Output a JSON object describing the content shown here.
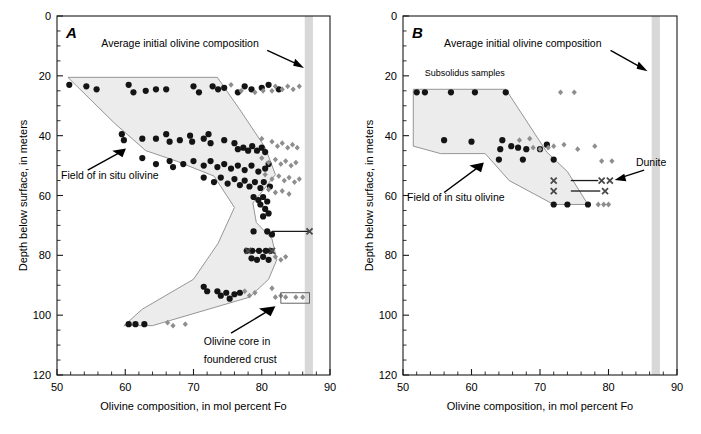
{
  "figure": {
    "background": "#ffffff",
    "width": 701,
    "height": 434,
    "caption_partial": ""
  },
  "colors": {
    "circle": "#141414",
    "diamond": "#8e8e8e",
    "x_marker": "#4a4a4a",
    "field_fill": "#ececec",
    "field_stroke": "#8a8a8a",
    "band": "#d8d8d8",
    "axis": "#1a1a1a"
  },
  "axes": {
    "x": {
      "label": "Olivine composition, in mol percent Fo",
      "min": 50,
      "max": 90,
      "major_ticks": [
        50,
        60,
        70,
        80,
        90
      ],
      "tick_labels": [
        "50",
        "60",
        "70",
        "80",
        "90"
      ],
      "minor_step": 2
    },
    "y": {
      "label": "Depth below surface, in meters",
      "min": 0,
      "max": 120,
      "major_ticks": [
        0,
        20,
        40,
        60,
        80,
        100,
        120
      ],
      "tick_labels": [
        "0",
        "20",
        "40",
        "60",
        "80",
        "100",
        "120"
      ],
      "minor_step": 5,
      "inverted": true
    }
  },
  "annotations": {
    "average_initial": "Average initial olivine composition",
    "field_in_situ": "Field of in situ olivine",
    "olivine_core_line1": "Olivine core in",
    "olivine_core_line2": "foundered crust",
    "subsolidus": "Subsolidus samples",
    "dunite": "Dunite"
  },
  "chart_data": [
    {
      "type": "scatter",
      "panel": "A",
      "title": "A",
      "xlabel": "Olivine composition, in mol percent Fo",
      "ylabel": "Depth below surface, in meters",
      "xlim": [
        50,
        90
      ],
      "ylim": [
        120,
        0
      ],
      "grid": false,
      "legend": "none",
      "band": {
        "name": "Average initial olivine composition",
        "x_start": 86.3,
        "x_end": 87.5
      },
      "field_polygon": {
        "name": "Field of in situ olivine",
        "vertices": [
          [
            51.6,
            20.5
          ],
          [
            73.5,
            20.5
          ],
          [
            77.0,
            32.0
          ],
          [
            80.5,
            44.0
          ],
          [
            82.0,
            53.0
          ],
          [
            80.3,
            58.0
          ],
          [
            78.7,
            62.5
          ],
          [
            79.2,
            69.0
          ],
          [
            81.5,
            74.5
          ],
          [
            82.2,
            81.5
          ],
          [
            81.0,
            88.0
          ],
          [
            78.2,
            94.0
          ],
          [
            64.0,
            103.5
          ],
          [
            59.8,
            103.5
          ],
          [
            62.5,
            98.0
          ],
          [
            70.0,
            88.0
          ],
          [
            73.6,
            76.0
          ],
          [
            76.0,
            64.0
          ],
          [
            73.0,
            53.5
          ],
          [
            67.5,
            48.5
          ],
          [
            63.0,
            45.0
          ],
          [
            58.5,
            36.0
          ]
        ]
      },
      "series": [
        {
          "name": "olivine (black circles)",
          "marker": "circle",
          "color": "#141414",
          "points": [
            [
              51.8,
              23.0
            ],
            [
              54.3,
              23.5
            ],
            [
              55.8,
              24.5
            ],
            [
              60.5,
              23.0
            ],
            [
              61.2,
              25.5
            ],
            [
              63.0,
              25.0
            ],
            [
              64.5,
              24.5
            ],
            [
              66.0,
              24.5
            ],
            [
              70.0,
              23.5
            ],
            [
              70.8,
              25.5
            ],
            [
              72.8,
              23.5
            ],
            [
              73.6,
              24.5
            ],
            [
              74.5,
              24.0
            ],
            [
              76.5,
              25.5
            ],
            [
              77.5,
              23.5
            ],
            [
              78.5,
              24.5
            ],
            [
              80.0,
              24.0
            ],
            [
              81.0,
              23.0
            ],
            [
              82.5,
              24.5
            ],
            [
              59.5,
              39.5
            ],
            [
              59.8,
              41.5
            ],
            [
              62.5,
              41.0
            ],
            [
              64.5,
              41.0
            ],
            [
              66.0,
              39.5
            ],
            [
              66.5,
              42.0
            ],
            [
              68.0,
              41.5
            ],
            [
              69.5,
              40.0
            ],
            [
              69.8,
              42.0
            ],
            [
              71.5,
              41.0
            ],
            [
              72.2,
              39.5
            ],
            [
              72.5,
              42.5
            ],
            [
              74.5,
              41.5
            ],
            [
              76.0,
              42.5
            ],
            [
              76.5,
              44.5
            ],
            [
              77.3,
              44.0
            ],
            [
              78.0,
              45.0
            ],
            [
              78.6,
              43.5
            ],
            [
              79.3,
              45.0
            ],
            [
              80.0,
              44.0
            ],
            [
              80.5,
              45.5
            ],
            [
              62.5,
              47.5
            ],
            [
              64.5,
              49.5
            ],
            [
              66.5,
              48.5
            ],
            [
              67.0,
              50.5
            ],
            [
              68.5,
              49.5
            ],
            [
              70.0,
              48.5
            ],
            [
              71.5,
              50.0
            ],
            [
              72.5,
              48.5
            ],
            [
              73.5,
              50.5
            ],
            [
              74.5,
              49.5
            ],
            [
              75.5,
              51.0
            ],
            [
              76.5,
              50.0
            ],
            [
              77.5,
              51.5
            ],
            [
              78.5,
              50.0
            ],
            [
              79.5,
              52.0
            ],
            [
              80.5,
              51.0
            ],
            [
              81.0,
              49.5
            ],
            [
              71.5,
              54.0
            ],
            [
              73.0,
              55.5
            ],
            [
              74.0,
              54.0
            ],
            [
              75.0,
              56.0
            ],
            [
              76.0,
              54.5
            ],
            [
              76.8,
              56.5
            ],
            [
              77.5,
              55.0
            ],
            [
              78.2,
              57.0
            ],
            [
              79.0,
              55.5
            ],
            [
              79.8,
              57.5
            ],
            [
              80.3,
              55.5
            ],
            [
              81.2,
              57.0
            ],
            [
              78.8,
              60.5
            ],
            [
              79.5,
              61.5
            ],
            [
              80.2,
              60.5
            ],
            [
              80.8,
              62.0
            ],
            [
              79.8,
              63.0
            ],
            [
              80.5,
              64.5
            ],
            [
              81.0,
              66.0
            ],
            [
              80.2,
              67.0
            ],
            [
              78.8,
              72.0
            ],
            [
              80.8,
              72.0
            ],
            [
              81.5,
              73.0
            ],
            [
              77.8,
              78.5
            ],
            [
              78.6,
              78.5
            ],
            [
              79.6,
              78.5
            ],
            [
              80.6,
              78.5
            ],
            [
              81.3,
              78.5
            ],
            [
              78.5,
              81.0
            ],
            [
              79.3,
              81.5
            ],
            [
              80.2,
              80.5
            ],
            [
              81.0,
              81.5
            ],
            [
              71.5,
              90.5
            ],
            [
              72.0,
              92.0
            ],
            [
              73.5,
              92.0
            ],
            [
              74.0,
              93.5
            ],
            [
              74.8,
              92.5
            ],
            [
              75.3,
              94.5
            ],
            [
              76.0,
              93.0
            ],
            [
              76.8,
              92.5
            ],
            [
              60.5,
              103.0
            ],
            [
              61.5,
              103.0
            ],
            [
              62.8,
              103.0
            ]
          ]
        },
        {
          "name": "olivine (gray diamonds)",
          "marker": "diamond",
          "color": "#8e8e8e",
          "points": [
            [
              75.5,
              23.0
            ],
            [
              77.0,
              25.0
            ],
            [
              79.0,
              25.5
            ],
            [
              80.2,
              25.0
            ],
            [
              81.5,
              25.0
            ],
            [
              82.0,
              23.5
            ],
            [
              83.0,
              24.5
            ],
            [
              83.8,
              23.5
            ],
            [
              84.6,
              24.5
            ],
            [
              85.5,
              23.5
            ],
            [
              80.0,
              41.0
            ],
            [
              81.5,
              42.0
            ],
            [
              82.3,
              43.5
            ],
            [
              83.0,
              42.5
            ],
            [
              83.8,
              44.0
            ],
            [
              84.5,
              43.0
            ],
            [
              85.2,
              44.0
            ],
            [
              80.0,
              47.5
            ],
            [
              81.0,
              49.0
            ],
            [
              82.0,
              48.0
            ],
            [
              82.8,
              49.5
            ],
            [
              83.5,
              48.5
            ],
            [
              84.3,
              50.0
            ],
            [
              85.0,
              49.0
            ],
            [
              80.5,
              53.0
            ],
            [
              81.5,
              54.5
            ],
            [
              82.5,
              53.5
            ],
            [
              83.3,
              55.0
            ],
            [
              84.0,
              54.0
            ],
            [
              84.8,
              55.5
            ],
            [
              85.5,
              54.5
            ],
            [
              81.0,
              58.0
            ],
            [
              82.0,
              59.0
            ],
            [
              83.0,
              58.5
            ],
            [
              84.0,
              59.5
            ],
            [
              82.0,
              80.5
            ],
            [
              82.8,
              81.5
            ],
            [
              83.5,
              80.5
            ],
            [
              77.5,
              92.0
            ],
            [
              78.2,
              93.5
            ],
            [
              79.0,
              92.5
            ],
            [
              81.5,
              91.0
            ],
            [
              82.0,
              94.0
            ],
            [
              82.8,
              93.5
            ],
            [
              83.5,
              94.0
            ],
            [
              85.0,
              94.0
            ],
            [
              86.0,
              94.0
            ],
            [
              66.2,
              102.5
            ],
            [
              67.0,
              103.5
            ],
            [
              68.8,
              103.0
            ]
          ]
        },
        {
          "name": "dunite olivine (x markers)",
          "marker": "x",
          "color": "#4a4a4a",
          "points": [
            [
              87.0,
              72.0
            ],
            [
              78.0,
              78.5
            ],
            [
              81.5,
              78.5
            ]
          ]
        }
      ],
      "tie_lines": [
        {
          "x1": 81.5,
          "x2": 87.0,
          "y": 72.0
        },
        {
          "x1": 78.0,
          "x2": 81.5,
          "y": 78.5
        }
      ],
      "core_box": {
        "x1": 82.8,
        "x2": 87.0,
        "y1": 92.5,
        "y2": 96.0
      }
    },
    {
      "type": "scatter",
      "panel": "B",
      "title": "B",
      "xlabel": "Olivine composition, in mol percent Fo",
      "ylabel": "Depth below surface, in meters",
      "xlim": [
        50,
        90
      ],
      "ylim": [
        120,
        0
      ],
      "grid": false,
      "legend": "none",
      "band": {
        "name": "Average initial olivine composition",
        "x_start": 86.3,
        "x_end": 87.5
      },
      "field_polygon": {
        "name": "Field of in situ olivine",
        "vertices": [
          [
            51.5,
            24.5
          ],
          [
            65.0,
            24.5
          ],
          [
            71.0,
            45.5
          ],
          [
            74.0,
            52.0
          ],
          [
            77.0,
            63.0
          ],
          [
            72.0,
            63.0
          ],
          [
            65.5,
            55.0
          ],
          [
            62.0,
            46.0
          ],
          [
            55.5,
            46.0
          ],
          [
            51.5,
            43.5
          ]
        ]
      },
      "series": [
        {
          "name": "olivine (black circles)",
          "marker": "circle",
          "color": "#141414",
          "points": [
            [
              52.0,
              25.5
            ],
            [
              53.2,
              25.5
            ],
            [
              57.0,
              25.5
            ],
            [
              60.5,
              25.5
            ],
            [
              65.0,
              25.5
            ],
            [
              56.0,
              41.5
            ],
            [
              60.0,
              42.0
            ],
            [
              64.5,
              41.5
            ],
            [
              64.2,
              44.5
            ],
            [
              65.8,
              43.5
            ],
            [
              66.8,
              44.0
            ],
            [
              68.0,
              44.5
            ],
            [
              70.0,
              44.5
            ],
            [
              71.0,
              43.0
            ],
            [
              64.0,
              48.0
            ],
            [
              67.5,
              48.0
            ],
            [
              72.0,
              48.0
            ],
            [
              72.0,
              63.0
            ],
            [
              74.0,
              63.0
            ],
            [
              77.0,
              63.0
            ]
          ]
        },
        {
          "name": "olivine (gray diamonds)",
          "marker": "diamond",
          "color": "#8e8e8e",
          "points": [
            [
              73.0,
              25.5
            ],
            [
              75.0,
              25.5
            ],
            [
              67.0,
              41.5
            ],
            [
              68.5,
              41.0
            ],
            [
              69.0,
              44.0
            ],
            [
              70.0,
              44.5
            ],
            [
              71.2,
              44.0
            ],
            [
              72.0,
              43.5
            ],
            [
              73.5,
              43.0
            ],
            [
              75.5,
              44.5
            ],
            [
              78.0,
              43.5
            ],
            [
              79.0,
              48.5
            ],
            [
              80.5,
              48.5
            ],
            [
              78.5,
              63.0
            ],
            [
              79.3,
              63.0
            ],
            [
              80.0,
              63.0
            ]
          ]
        },
        {
          "name": "dunite olivine (x markers)",
          "marker": "x",
          "color": "#4a4a4a",
          "points": [
            [
              72.0,
              55.0
            ],
            [
              79.0,
              55.0
            ],
            [
              80.2,
              55.0
            ],
            [
              72.0,
              58.5
            ],
            [
              79.5,
              58.5
            ]
          ]
        }
      ],
      "tie_lines": [
        {
          "x1": 74.5,
          "x2": 78.5,
          "y": 55.0
        },
        {
          "x1": 74.5,
          "x2": 78.8,
          "y": 58.5
        }
      ],
      "core_box": null
    }
  ]
}
